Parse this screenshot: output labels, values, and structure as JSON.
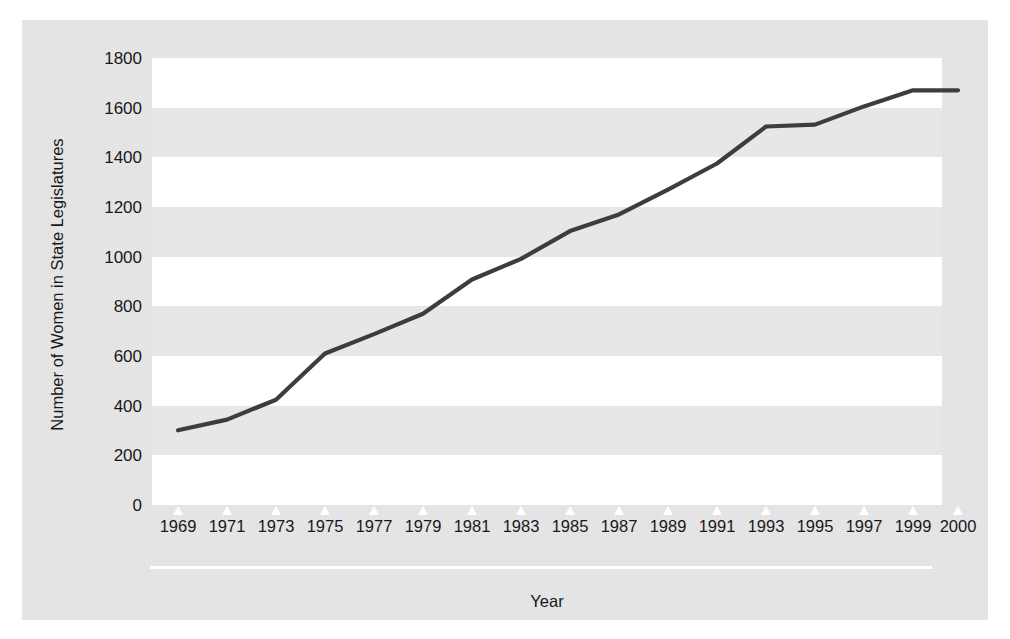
{
  "chart_data": {
    "type": "line",
    "title": "",
    "xlabel": "Year",
    "ylabel": "Number of Women in State Legislatures",
    "ylim": [
      0,
      1800
    ],
    "ytick_labels": [
      "1800",
      "1600",
      "1400",
      "1200",
      "1000",
      "800",
      "600",
      "400",
      "200",
      "0"
    ],
    "ytick_values": [
      1800,
      1600,
      1400,
      1200,
      1000,
      800,
      600,
      400,
      200,
      0
    ],
    "grid": false,
    "banded_background": true,
    "legend": "none",
    "categories": [
      "1969",
      "1971",
      "1973",
      "1975",
      "1977",
      "1979",
      "1981",
      "1983",
      "1985",
      "1987",
      "1989",
      "1991",
      "1993",
      "1995",
      "1997",
      "1999",
      "2000"
    ],
    "x": [
      1969,
      1971,
      1973,
      1975,
      1977,
      1979,
      1981,
      1983,
      1985,
      1987,
      1989,
      1991,
      1993,
      1995,
      1997,
      1999,
      2000
    ],
    "values": [
      301,
      344,
      424,
      610,
      688,
      770,
      908,
      991,
      1103,
      1170,
      1270,
      1375,
      1524,
      1532,
      1605,
      1670,
      1670
    ],
    "series": [
      {
        "name": "Number of Women in State Legislatures",
        "color": "#3d3d3f",
        "values": [
          301,
          344,
          424,
          610,
          688,
          770,
          908,
          991,
          1103,
          1170,
          1270,
          1375,
          1524,
          1532,
          1605,
          1670,
          1670
        ]
      }
    ]
  },
  "colors": {
    "panel_background": "#e7e7e7",
    "band_highlight": "#ffffff",
    "line": "#3d3d3f",
    "text": "#18181a",
    "tick_mark": "#ffffff"
  }
}
